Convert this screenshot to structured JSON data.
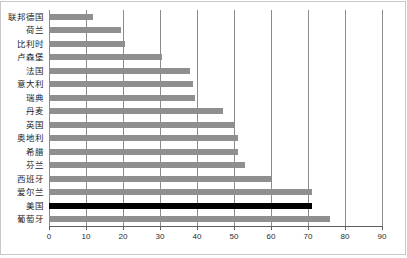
{
  "chart_data": {
    "type": "bar",
    "orientation": "horizontal",
    "title": "",
    "subtitle": "",
    "xlabel": "",
    "ylabel": "",
    "xlim": [
      0,
      90
    ],
    "ylim": null,
    "grid": true,
    "legend": null,
    "legend_position": "none",
    "xticks": [
      0,
      10,
      20,
      30,
      40,
      50,
      60,
      70,
      80,
      90
    ],
    "xtick_labels": [
      "0",
      "10",
      "20",
      "30",
      "40",
      "50",
      "60",
      "70",
      "80",
      "90"
    ],
    "categories": [
      "联邦德国",
      "荷兰",
      "比利时",
      "卢森堡",
      "法国",
      "意大利",
      "瑞典",
      "丹麦",
      "英国",
      "奥地利",
      "希腊",
      "芬兰",
      "西班牙",
      "爱尔兰",
      "美国",
      "葡萄牙"
    ],
    "values": [
      12,
      19.5,
      20.5,
      30.5,
      38,
      39,
      39.5,
      47,
      50,
      51,
      51,
      53,
      60,
      71,
      71,
      76
    ],
    "bar_colors": [
      "#8f8f8f",
      "#8f8f8f",
      "#8f8f8f",
      "#8f8f8f",
      "#8f8f8f",
      "#8f8f8f",
      "#8f8f8f",
      "#8f8f8f",
      "#8f8f8f",
      "#8f8f8f",
      "#8f8f8f",
      "#8f8f8f",
      "#8f8f8f",
      "#8f8f8f",
      "#000000",
      "#8f8f8f"
    ],
    "highlight_category": "美国",
    "highlight_color": "#000000",
    "series_color": "#8f8f8f",
    "gridline_color": "#8c8c8c",
    "axis_color": "#5f5f5f",
    "border_color": "#c9c9c9",
    "background_color": "#ffffff"
  }
}
